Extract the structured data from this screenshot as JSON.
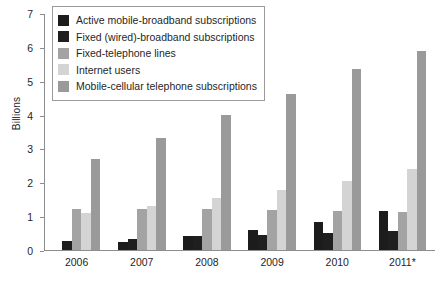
{
  "chart_data": {
    "type": "bar",
    "title": "",
    "subtitle": "",
    "xlabel": "",
    "ylabel": "Billions",
    "categories": [
      "2006",
      "2007",
      "2008",
      "2009",
      "2010",
      "2011*"
    ],
    "ylim": [
      0,
      7
    ],
    "yticks": [
      "0",
      "1",
      "2",
      "3",
      "4",
      "5",
      "6",
      "7"
    ],
    "grid": false,
    "legend_position": "top-left",
    "series": [
      {
        "name": "Active mobile-broadband subscriptions",
        "color": "#1c1c1c",
        "values": [
          0.0,
          0.25,
          0.4,
          0.58,
          0.83,
          1.16
        ]
      },
      {
        "name": "Fixed (wired)-broadband subscriptions",
        "color": "#1f1f1f",
        "values": [
          0.27,
          0.33,
          0.4,
          0.44,
          0.5,
          0.57
        ]
      },
      {
        "name": "Fixed-telephone lines",
        "color": "#a3a3a3",
        "values": [
          1.21,
          1.22,
          1.22,
          1.18,
          1.15,
          1.12
        ]
      },
      {
        "name": "Internet users",
        "color": "#d4d4d4",
        "values": [
          1.1,
          1.31,
          1.55,
          1.76,
          2.03,
          2.38
        ]
      },
      {
        "name": "Mobile-cellular telephone subscriptions",
        "color": "#9a9a9a",
        "values": [
          2.68,
          3.31,
          4.0,
          4.62,
          5.34,
          5.88
        ]
      }
    ]
  },
  "axis": {
    "ylabel": "Billions"
  }
}
